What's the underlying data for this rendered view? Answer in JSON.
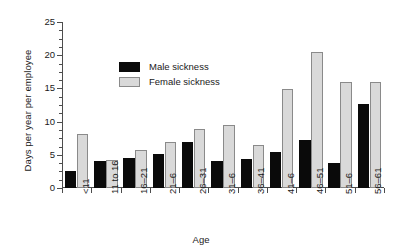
{
  "chart_data": {
    "type": "bar",
    "title": "",
    "subtitle": "",
    "xlabel": "Age",
    "ylabel": "Days per year per employee",
    "categories": [
      "<11",
      "11 to 16",
      "16–21",
      "21–6",
      "26–31",
      "31–6",
      "36–41",
      "41–6",
      "46–51",
      "51–6",
      "56–61"
    ],
    "series": [
      {
        "name": "Male sickness",
        "color": "#0a0a0a",
        "values": [
          2.5,
          4.0,
          4.5,
          5.1,
          7.0,
          4.0,
          4.3,
          5.4,
          7.3,
          3.7,
          12.7
        ]
      },
      {
        "name": "Female sickness",
        "color": "#d9d9d9",
        "values": [
          8.2,
          4.2,
          5.7,
          7.0,
          8.9,
          9.5,
          6.5,
          14.9,
          20.5,
          16.0,
          16.0
        ]
      }
    ],
    "ylim": [
      0,
      25
    ],
    "yticks": [
      0,
      5,
      10,
      15,
      20,
      25
    ],
    "ytick_labels": [
      "0",
      "5",
      "10",
      "15",
      "20",
      "25"
    ],
    "yminor_step": 1.25,
    "grid": false,
    "legend_position": "upper-center-left"
  },
  "legend": {
    "items": [
      {
        "label": "Male sickness",
        "swatch": "male-swatch"
      },
      {
        "label": "Female sickness",
        "swatch": "female-swatch"
      }
    ]
  }
}
